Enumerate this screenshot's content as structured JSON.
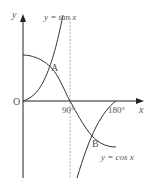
{
  "diagram": {
    "axes": {
      "x_label": "x",
      "y_label": "y",
      "origin_label": "O"
    },
    "ticks": {
      "t90": "90°",
      "t180": "180°"
    },
    "curves": {
      "tan_label": "y = tan x",
      "cos_label": "y = cos x"
    },
    "points": {
      "A": "A",
      "B": "B"
    },
    "colors": {
      "curve": "#333333",
      "axis": "#222222",
      "asymptote": "#999999",
      "text": "#555555"
    }
  }
}
